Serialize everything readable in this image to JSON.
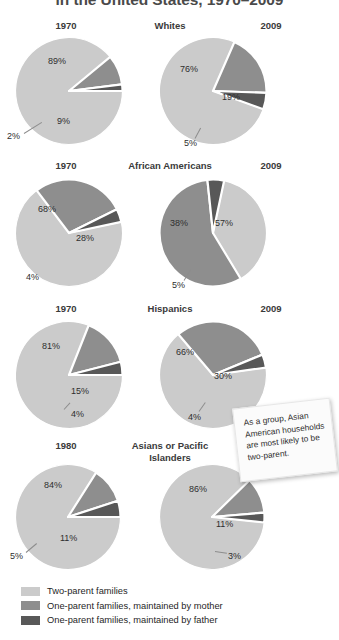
{
  "title": "in the United States, 1970–2009",
  "colors": {
    "two_parent": "#cbcbcb",
    "mother": "#8e8e8e",
    "father": "#585858",
    "separator": "#ffffff",
    "text": "#2e2e2e"
  },
  "legend": {
    "items": [
      {
        "label": "Two-parent families",
        "color": "#cbcbcb",
        "key": "two_parent"
      },
      {
        "label": "One-parent families, maintained by mother",
        "color": "#8e8e8e",
        "key": "mother"
      },
      {
        "label": "One-parent families, maintained by father",
        "color": "#585858",
        "key": "father"
      }
    ]
  },
  "callout": {
    "text": "As a group, Asian American households are most likely to be two-parent."
  },
  "footnote": "",
  "chart_data": {
    "type": "pie",
    "title": "in the United States, 1970–2009",
    "series_labels": [
      "Two-parent families",
      "One-parent families, maintained by mother",
      "One-parent families, maintained by father"
    ],
    "groups": [
      {
        "group": "Whites",
        "charts": [
          {
            "year": "1970",
            "values": [
              89,
              9,
              2
            ],
            "labels": [
              "89%",
              "9%",
              "2%"
            ]
          },
          {
            "year": "2009",
            "values": [
              76,
              19,
              5
            ],
            "labels": [
              "76%",
              "19%",
              "5%"
            ]
          }
        ]
      },
      {
        "group": "African Americans",
        "charts": [
          {
            "year": "1970",
            "values": [
              68,
              28,
              4
            ],
            "labels": [
              "68%",
              "28%",
              "4%"
            ]
          },
          {
            "year": "2009",
            "values": [
              38,
              57,
              5
            ],
            "labels": [
              "38%",
              "57%",
              "5%"
            ]
          }
        ]
      },
      {
        "group": "Hispanics",
        "charts": [
          {
            "year": "1970",
            "values": [
              81,
              15,
              4
            ],
            "labels": [
              "81%",
              "15%",
              "4%"
            ]
          },
          {
            "year": "2009",
            "values": [
              66,
              30,
              4
            ],
            "labels": [
              "66%",
              "30%",
              "4%"
            ]
          }
        ]
      },
      {
        "group": "Asians or Pacific Islanders",
        "charts": [
          {
            "year": "1980",
            "values": [
              84,
              11,
              5
            ],
            "labels": [
              "84%",
              "11%",
              "5%"
            ]
          },
          {
            "year": "2009",
            "values": [
              86,
              11,
              3
            ],
            "labels": [
              "86%",
              "11%",
              "3%"
            ]
          }
        ]
      }
    ]
  },
  "sections": [
    {
      "group_label": "Whites",
      "left_year": "1970",
      "right_year": "2009"
    },
    {
      "group_label": "African Americans",
      "left_year": "1970",
      "right_year": "2009"
    },
    {
      "group_label": "Hispanics",
      "left_year": "1970",
      "right_year": "2009"
    },
    {
      "group_label": "Asians or Pacific Islanders",
      "left_year": "1980",
      "right_year": "2009"
    }
  ]
}
